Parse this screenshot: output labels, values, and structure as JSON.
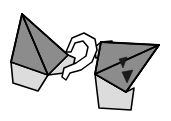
{
  "figure": {
    "background_color": "#ffffff",
    "width": 171,
    "height": 121,
    "palette": {
      "face_dark_gray": "#8c8c8c",
      "face_light_gray": "#dcdcdc",
      "face_white": "#fafafa",
      "outline_black": "#000000",
      "marker_black": "#1a1a1a"
    },
    "objects": [
      {
        "id": "left-solid",
        "label": "left polyhedron",
        "faces": [
          {
            "name": "left-main-face",
            "shade": "dark",
            "points": "22,14 11,62 48,75 22,14"
          },
          {
            "name": "left-upper-face",
            "shade": "dark",
            "points": "22,14 68,55 48,75 22,14"
          },
          {
            "name": "left-right-face",
            "shade": "light",
            "points": "68,55 48,75 72,72 75,58 68,55"
          },
          {
            "name": "left-bottom-flap",
            "shade": "light",
            "points": "11,62 13,83 38,91 48,75 11,62"
          }
        ],
        "edges": [
          {
            "name": "left-edge-apex-to-base",
            "points": "22,14 48,75"
          },
          {
            "name": "left-edge-apex-to-right",
            "points": "22,14 68,55"
          },
          {
            "name": "left-edge-left-side",
            "points": "22,14 11,62"
          }
        ]
      },
      {
        "id": "connector-ribbon",
        "label": "white looping ribbon connector",
        "shade": "white",
        "points": "66,52 72,38 84,33 95,39 97,50 92,62 81,70 70,73 66,80 62,77 64,68 76,63 86,56 88,47 83,41 75,43 71,52 66,52"
      },
      {
        "id": "right-solid",
        "label": "right polyhedron",
        "faces": [
          {
            "name": "right-top-small-face",
            "shade": "light",
            "points": "94,48 101,42 112,41 110,56 96,58 94,48"
          },
          {
            "name": "right-main-face",
            "shade": "dark",
            "points": "101,42 159,45 126,92 95,74 101,42"
          },
          {
            "name": "right-lower-face",
            "shade": "dark",
            "points": "95,74 126,92 159,45 95,74"
          },
          {
            "name": "right-bottom-flap",
            "shade": "light",
            "points": "95,74 99,108 131,110 134,88 126,92 95,74"
          }
        ],
        "edges": [
          {
            "name": "right-edge-diagonal",
            "points": "159,45 95,74"
          },
          {
            "name": "right-edge-top",
            "points": "101,42 159,45"
          },
          {
            "name": "right-edge-left",
            "points": "101,42 95,74"
          },
          {
            "name": "right-edge-bottom",
            "points": "126,92 159,45"
          }
        ],
        "markers": [
          {
            "name": "arrowhead-upper",
            "direction": "down",
            "points": "119,59 127,57 123,68 119,59"
          },
          {
            "name": "arrowhead-lower",
            "direction": "down",
            "points": "122,72 133,70 127,83 122,72"
          }
        ]
      }
    ]
  }
}
